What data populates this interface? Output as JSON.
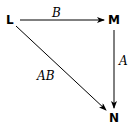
{
  "diagram": {
    "type": "commutative-diagram",
    "nodes": [
      {
        "id": "L",
        "label": "L"
      },
      {
        "id": "M",
        "label": "M"
      },
      {
        "id": "N",
        "label": "N"
      }
    ],
    "edges": [
      {
        "from": "L",
        "to": "M",
        "label": "B"
      },
      {
        "from": "M",
        "to": "N",
        "label": "A"
      },
      {
        "from": "L",
        "to": "N",
        "label": "AB"
      }
    ]
  }
}
